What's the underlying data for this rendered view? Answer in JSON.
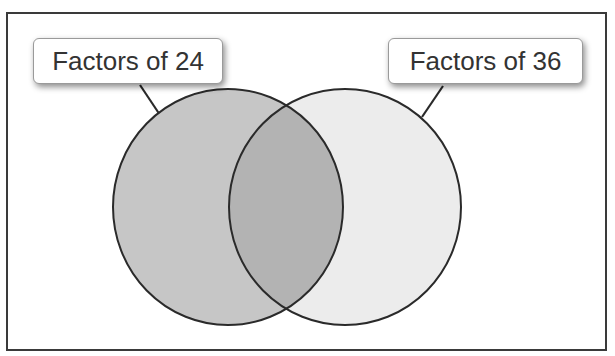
{
  "diagram": {
    "type": "venn",
    "sets": [
      {
        "label": "Factors of 24",
        "fill": "#c6c6c6"
      },
      {
        "label": "Factors of 36",
        "fill": "#ececec"
      }
    ],
    "intersection_fill": "#b3b3b3",
    "stroke": "#2a2a2a",
    "frame_stroke": "#3a3a3a"
  }
}
